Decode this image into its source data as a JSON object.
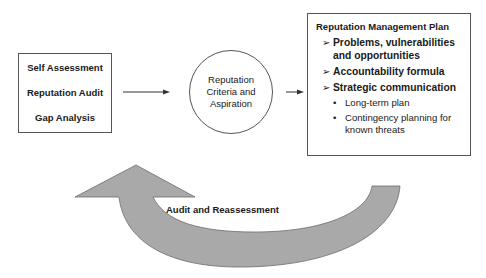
{
  "diagram": {
    "left_box": {
      "items": [
        "Self Assessment",
        "Reputation Audit",
        "Gap Analysis"
      ]
    },
    "center_circle": {
      "lines": [
        "Reputation",
        "Criteria and",
        "Aspiration"
      ]
    },
    "right_box": {
      "title": "Reputation Management Plan",
      "chevron_marker": "➢",
      "bullet_marker": "•",
      "points": [
        {
          "text": "Problems, vulnerabilities and opportunities"
        },
        {
          "text": "Accountability formula"
        },
        {
          "text": "Strategic communication"
        }
      ],
      "sub_points": [
        {
          "text": "Long-term plan"
        },
        {
          "text": "Contingency planning for known threats"
        }
      ]
    },
    "loop_arrow": {
      "label": "Audit and Reassessment",
      "fill_color": "#a9a9a9",
      "stroke_color": "#6b6b6b"
    },
    "connectors": [
      {
        "from": "left_box",
        "to": "center_circle"
      },
      {
        "from": "center_circle",
        "to": "right_box"
      }
    ]
  }
}
